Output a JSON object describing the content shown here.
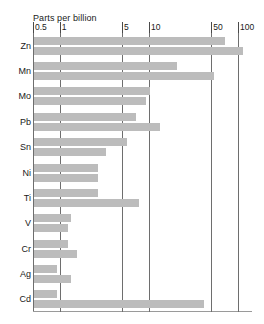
{
  "chart_data": {
    "type": "bar",
    "title": "Parts per billion",
    "xlabel": "Parts per billion",
    "ylabel": "",
    "orientation": "horizontal",
    "xscale": "log",
    "xlim": [
      0.4,
      130
    ],
    "grid": true,
    "legend": "none",
    "xticks": [
      {
        "label": "0.5",
        "value": 0.5
      },
      {
        "label": "1",
        "value": 1
      },
      {
        "label": "5",
        "value": 5
      },
      {
        "label": "10",
        "value": 10
      },
      {
        "label": "50",
        "value": 50
      },
      {
        "label": "100",
        "value": 100
      }
    ],
    "categories": [
      "Zn",
      "Mn",
      "Mo",
      "Pb",
      "Sn",
      "Ni",
      "Ti",
      "V",
      "Cr",
      "Ag",
      "Cd"
    ],
    "series": [
      {
        "name": "bar-1",
        "values": [
          70,
          20,
          10,
          7,
          5.5,
          2.6,
          2.6,
          1.3,
          1.2,
          0.9,
          0.9
        ]
      },
      {
        "name": "bar-2",
        "values": [
          110,
          53,
          9,
          13,
          3.2,
          2.6,
          7.5,
          1.2,
          1.5,
          1.3,
          40
        ]
      }
    ]
  }
}
